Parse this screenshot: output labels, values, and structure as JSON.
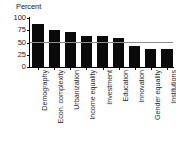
{
  "chart_data": {
    "type": "bar",
    "title": "",
    "ylabel": "Percent",
    "xlabel": "",
    "ylim": [
      0,
      100
    ],
    "yticks": [
      0,
      25,
      50,
      75,
      100
    ],
    "ytick_labels": [
      "0",
      "25",
      "50",
      "75",
      "100"
    ],
    "grid": false,
    "legend": "none",
    "orientation": "vertical",
    "bar_color": "#0a0a0a",
    "categories": [
      "Demography",
      "Econ. complexity",
      "Urbanization",
      "Income equality",
      "Investment",
      "Education",
      "Innovation",
      "Gender equality",
      "Institutions"
    ],
    "values": [
      88,
      76,
      71,
      64,
      64,
      60,
      43,
      36,
      36
    ],
    "annotations": [
      {
        "name": "reference-line",
        "type": "hline",
        "value": 50,
        "color": "#8e8e8e",
        "label": ""
      }
    ]
  }
}
